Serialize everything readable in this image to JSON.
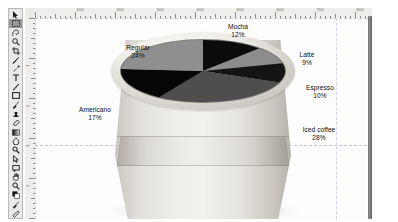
{
  "app": {
    "name": "image-editor",
    "document_background": "#fdfdfd"
  },
  "toolbar": {
    "name": "tools-palette",
    "selected_index": 1,
    "items": [
      {
        "id": "move-tool",
        "label": "Move"
      },
      {
        "id": "marquee-tool",
        "label": "Rectangular Marquee"
      },
      {
        "id": "lasso-tool",
        "label": "Lasso"
      },
      {
        "id": "magic-wand-tool",
        "label": "Magic Wand"
      },
      {
        "id": "crop-tool",
        "label": "Crop"
      },
      {
        "id": "eyedropper-tool",
        "label": "Eyedropper"
      },
      {
        "id": "healing-brush-tool",
        "label": "Healing Brush"
      },
      {
        "id": "type-tool",
        "label": "Horizontal Type"
      },
      {
        "id": "pen-tool",
        "label": "Pen"
      },
      {
        "id": "shape-tool",
        "label": "Rectangle Shape"
      },
      {
        "id": "brush-tool",
        "label": "Brush"
      },
      {
        "id": "clone-stamp-tool",
        "label": "Clone Stamp"
      },
      {
        "id": "eraser-tool",
        "label": "Eraser"
      },
      {
        "id": "gradient-tool",
        "label": "Gradient"
      },
      {
        "id": "blur-tool",
        "label": "Blur"
      },
      {
        "id": "dodge-tool",
        "label": "Dodge"
      },
      {
        "id": "path-select-tool",
        "label": "Path Selection"
      },
      {
        "id": "notes-tool",
        "label": "Notes"
      },
      {
        "id": "hand-tool",
        "label": "Hand"
      },
      {
        "id": "zoom-tool",
        "label": "Zoom"
      },
      {
        "id": "foreground-color-swatch",
        "label": "Foreground Color"
      },
      {
        "id": "quick-mask-tool",
        "label": "Quick Mask"
      },
      {
        "id": "screen-mode-tool",
        "label": "Screen Mode"
      }
    ]
  },
  "rulers": {
    "unit": "px",
    "horizontal_labels": [
      "100",
      "200",
      "300",
      "400",
      "500",
      "600",
      "700",
      "800"
    ],
    "vertical_labels": [
      "1",
      "2",
      "3",
      "4",
      "5",
      "6"
    ]
  },
  "chart_data": {
    "type": "pie",
    "title": "",
    "legend_position": "callout-labels",
    "categories": [
      "Mocha",
      "Latte",
      "Espresso",
      "Iced coffee",
      "Americano",
      "Regular"
    ],
    "values": [
      12,
      9,
      10,
      28,
      17,
      24
    ],
    "value_suffix": "%",
    "colors": [
      "#0b0b0b",
      "#8c8c8c",
      "#141414",
      "#4e4e4e",
      "#060606",
      "#8f8f8f"
    ],
    "start_angle_deg": 0,
    "direction": "clockwise",
    "labels": [
      {
        "name": "Mocha",
        "value": "12%",
        "color": "#0b0b0b"
      },
      {
        "name": "Latte",
        "value": "9%",
        "color": "#8c8c8c"
      },
      {
        "name": "Espresso",
        "value": "10%",
        "color": "#141414"
      },
      {
        "name": "Iced coffee",
        "value": "28%",
        "color": "#4e4e4e"
      },
      {
        "name": "Americano",
        "value": "17%",
        "color": "#060606"
      },
      {
        "name": "Regular",
        "value": "24%",
        "color": "#8f8f8f"
      }
    ]
  },
  "artwork": {
    "subject": "paper-coffee-cup",
    "cup_color": "#e8e6e0",
    "rim_color": "#f2f1ec"
  }
}
